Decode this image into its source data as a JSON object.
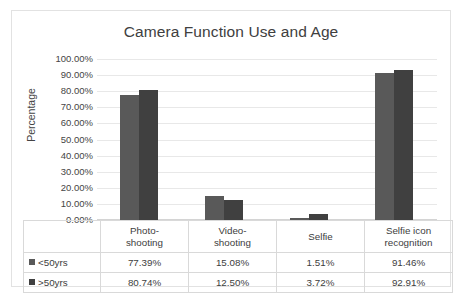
{
  "chart_data": {
    "type": "bar",
    "title": "Camera Function Use and Age",
    "xlabel": "",
    "ylabel": "Percentage",
    "ylim": [
      0,
      100
    ],
    "ytick_labels": [
      "100.00%",
      "90.00%",
      "80.00%",
      "70.00%",
      "60.00%",
      "50.00%",
      "40.00%",
      "30.00%",
      "20.00%",
      "10.00%",
      "0.00%"
    ],
    "ytick_values": [
      100,
      90,
      80,
      70,
      60,
      50,
      40,
      30,
      20,
      10,
      0
    ],
    "grid": true,
    "legend_position": "data-table-left",
    "categories": [
      "Photo-shooting",
      "Video-shooting",
      "Selfie",
      "Selfie icon recognition"
    ],
    "category_lines": [
      [
        "Photo-",
        "shooting"
      ],
      [
        "Video-",
        "shooting"
      ],
      [
        "Selfie",
        ""
      ],
      [
        "Selfie icon",
        "recognition"
      ]
    ],
    "series": [
      {
        "name": "<50yrs",
        "color": "#595959",
        "values": [
          77.39,
          15.08,
          1.51,
          91.46
        ],
        "labels": [
          "77.39%",
          "15.08%",
          "1.51%",
          "91.46%"
        ]
      },
      {
        "name": ">50yrs",
        "color": "#404040",
        "values": [
          80.74,
          12.5,
          3.72,
          92.91
        ],
        "labels": [
          "80.74%",
          "12.50%",
          "3.72%",
          "92.91%"
        ]
      }
    ]
  },
  "colors": {
    "series_1": "#595959",
    "series_2": "#404040",
    "gridline": "#e8e8e8",
    "frame_border": "#e2e2e2",
    "table_border": "#d9d9d9",
    "text": "#404040",
    "background": "#ffffff"
  }
}
